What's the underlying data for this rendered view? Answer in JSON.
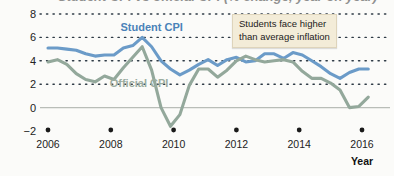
{
  "chart_data": {
    "type": "line",
    "title": "Student CPI vs official CPI (% change, year on year)",
    "xlabel": "Year",
    "ylabel": "",
    "xlim": [
      2006,
      2016.3
    ],
    "ylim": [
      -2,
      8
    ],
    "grid": true,
    "grid_style": "dotted-horizontal",
    "legend": "inline-labels",
    "xticks": [
      2006,
      2008,
      2010,
      2012,
      2014,
      2016
    ],
    "xtick_labels": [
      "2006",
      "2008",
      "2010",
      "2012",
      "2014",
      "2016"
    ],
    "yticks": [
      -2,
      0,
      2,
      4,
      6,
      8
    ],
    "ytick_labels": [
      "−2",
      "0",
      "2",
      "4",
      "6",
      "8"
    ],
    "zero_line": 0,
    "series": [
      {
        "name": "Student CPI",
        "color": "#6b9bc8",
        "label_color": "#4a82b8",
        "label_x": 2009.3,
        "label_y": 6.55,
        "x": [
          2006.0,
          2006.3,
          2006.6,
          2006.9,
          2007.2,
          2007.5,
          2007.8,
          2008.1,
          2008.4,
          2008.7,
          2009.0,
          2009.3,
          2009.6,
          2009.9,
          2010.2,
          2010.5,
          2010.8,
          2011.1,
          2011.4,
          2011.7,
          2012.0,
          2012.3,
          2012.6,
          2012.9,
          2013.2,
          2013.5,
          2013.8,
          2014.1,
          2014.4,
          2014.7,
          2015.0,
          2015.3,
          2015.6,
          2015.9,
          2016.2
        ],
        "values": [
          5.1,
          5.1,
          5.0,
          4.9,
          4.6,
          4.4,
          4.5,
          4.5,
          5.1,
          5.3,
          6.0,
          5.2,
          4.0,
          3.3,
          2.8,
          3.2,
          3.7,
          4.1,
          3.6,
          4.1,
          4.3,
          3.9,
          4.0,
          4.6,
          4.6,
          4.2,
          4.7,
          4.5,
          4.0,
          3.5,
          2.9,
          2.5,
          3.0,
          3.3,
          3.3
        ]
      },
      {
        "name": "Official CPI",
        "color": "#93a89b",
        "label_color": "#9bada0",
        "label_x": 2008.9,
        "label_y": 1.75,
        "x": [
          2006.0,
          2006.3,
          2006.6,
          2006.9,
          2007.2,
          2007.5,
          2007.8,
          2008.1,
          2008.4,
          2008.7,
          2009.0,
          2009.3,
          2009.6,
          2009.9,
          2010.2,
          2010.5,
          2010.8,
          2011.1,
          2011.4,
          2011.7,
          2012.0,
          2012.3,
          2012.6,
          2012.9,
          2013.2,
          2013.5,
          2013.8,
          2014.1,
          2014.4,
          2014.7,
          2015.0,
          2015.3,
          2015.6,
          2015.9,
          2016.2
        ],
        "values": [
          3.9,
          4.1,
          3.7,
          2.9,
          2.4,
          2.2,
          2.7,
          2.4,
          3.4,
          4.3,
          5.2,
          3.2,
          0.0,
          -1.6,
          -0.6,
          1.9,
          3.3,
          3.3,
          2.6,
          3.2,
          4.0,
          4.4,
          4.1,
          3.9,
          4.0,
          4.1,
          3.9,
          3.1,
          2.5,
          2.5,
          2.1,
          1.5,
          0.0,
          0.1,
          0.9
        ]
      }
    ],
    "annotations": [
      {
        "name": "students-face-higher-inflation",
        "line1": "Students face higher",
        "line2": "than average inflation",
        "background": "#f3ecd8",
        "border": "#ded4bb"
      }
    ]
  },
  "axis": {
    "x_axis_name": "Year"
  },
  "colors": {
    "student_cpi": "#6b9bc8",
    "official_cpi": "#93a89b",
    "grid": "#2f3b46",
    "zero_line": "#b9bdb8",
    "annotation_bg": "#f3ecd8",
    "background": "#fbfbf9"
  }
}
